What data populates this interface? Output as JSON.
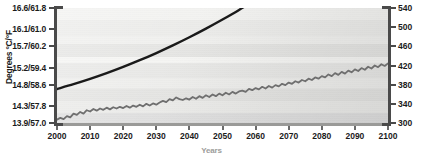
{
  "chart_data": {
    "type": "line",
    "title": "",
    "xlabel": "Years",
    "ylabel": "Degrees °C/°F",
    "ylabel_right": "",
    "grid": false,
    "legend": "none",
    "xlim": [
      2000,
      2100
    ],
    "xticks": [
      2000,
      2010,
      2020,
      2030,
      2040,
      2050,
      2060,
      2070,
      2080,
      2090,
      2100
    ],
    "xtick_labels": [
      "2000",
      "2010",
      "2020",
      "2030",
      "2040",
      "2050",
      "2060",
      "2070",
      "2080",
      "2090",
      "2100"
    ],
    "ylim_left": [
      13.9,
      16.6
    ],
    "yticks_left": [
      13.9,
      14.3,
      14.8,
      15.2,
      15.7,
      16.1,
      16.6
    ],
    "ytick_labels_left": [
      "13.9/57.0",
      "14.3/57.8",
      "14.8/58.6",
      "15.2/59.4",
      "15.7/60.2",
      "16.1/61.0",
      "16.6/61.8"
    ],
    "ylim_right": [
      300,
      540
    ],
    "yticks_right": [
      300,
      340,
      380,
      420,
      460,
      500,
      540
    ],
    "ytick_labels_right": [
      "300",
      "340",
      "380",
      "420",
      "460",
      "500",
      "540"
    ],
    "series": [
      {
        "name": "co2-concentration",
        "axis": "right",
        "color": "#1a1a1a",
        "style": "smooth",
        "width": 2.4,
        "x": [
          2000,
          2005,
          2010,
          2015,
          2020,
          2025,
          2030,
          2035,
          2040,
          2045,
          2050,
          2055,
          2060,
          2065,
          2070,
          2075
        ],
        "values": [
          371,
          381,
          392,
          404,
          417,
          431,
          446,
          462,
          479,
          497,
          516,
          536,
          558,
          581,
          606,
          632
        ]
      },
      {
        "name": "global-temperature",
        "axis": "left",
        "color": "#6f6f6f",
        "style": "noisy",
        "width": 1.8,
        "x": [
          2000,
          2001,
          2002,
          2003,
          2004,
          2005,
          2006,
          2007,
          2008,
          2009,
          2010,
          2011,
          2012,
          2013,
          2014,
          2015,
          2016,
          2017,
          2018,
          2019,
          2020,
          2021,
          2022,
          2023,
          2024,
          2025,
          2026,
          2027,
          2028,
          2029,
          2030,
          2031,
          2032,
          2033,
          2034,
          2035,
          2036,
          2037,
          2038,
          2039,
          2040,
          2041,
          2042,
          2043,
          2044,
          2045,
          2046,
          2047,
          2048,
          2049,
          2050,
          2051,
          2052,
          2053,
          2054,
          2055,
          2056,
          2057,
          2058,
          2059,
          2060,
          2061,
          2062,
          2063,
          2064,
          2065,
          2066,
          2067,
          2068,
          2069,
          2070,
          2071,
          2072,
          2073,
          2074,
          2075,
          2076,
          2077,
          2078,
          2079,
          2080,
          2081,
          2082,
          2083,
          2084,
          2085,
          2086,
          2087,
          2088,
          2089,
          2090,
          2091,
          2092,
          2093,
          2094,
          2095,
          2096,
          2097,
          2098,
          2099,
          2100
        ],
        "values": [
          13.98,
          14.02,
          13.99,
          14.06,
          14.03,
          14.12,
          14.09,
          14.16,
          14.12,
          14.2,
          14.17,
          14.23,
          14.19,
          14.24,
          14.21,
          14.26,
          14.22,
          14.27,
          14.24,
          14.28,
          14.25,
          14.3,
          14.26,
          14.31,
          14.28,
          14.33,
          14.29,
          14.35,
          14.31,
          14.36,
          14.33,
          14.38,
          14.42,
          14.39,
          14.46,
          14.43,
          14.5,
          14.46,
          14.44,
          14.48,
          14.45,
          14.51,
          14.47,
          14.53,
          14.49,
          14.55,
          14.51,
          14.57,
          14.53,
          14.59,
          14.55,
          14.61,
          14.57,
          14.63,
          14.59,
          14.64,
          14.66,
          14.63,
          14.7,
          14.67,
          14.72,
          14.69,
          14.75,
          14.71,
          14.77,
          14.73,
          14.79,
          14.76,
          14.82,
          14.79,
          14.85,
          14.82,
          14.88,
          14.85,
          14.91,
          14.88,
          14.94,
          14.91,
          14.97,
          14.94,
          15.0,
          14.97,
          15.04,
          15.0,
          15.07,
          15.03,
          15.1,
          15.06,
          15.13,
          15.09,
          15.16,
          15.12,
          15.19,
          15.15,
          15.22,
          15.18,
          15.25,
          15.21,
          15.28,
          15.24,
          15.3
        ]
      }
    ]
  },
  "axes": {
    "y_title": "Degrees °C/°F",
    "x_title": "Years"
  }
}
